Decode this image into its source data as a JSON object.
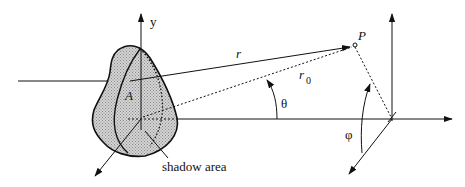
{
  "diagram": {
    "labels": {
      "y_axis": "y",
      "point_A": "A",
      "point_P": "P",
      "r": "r",
      "r0_base": "r",
      "r0_sub": "0",
      "theta": "θ",
      "phi": "φ",
      "shadow": "shadow area"
    },
    "colors": {
      "line": "#111111",
      "body_fill": "#c8c8c8",
      "background": "#ffffff"
    }
  }
}
